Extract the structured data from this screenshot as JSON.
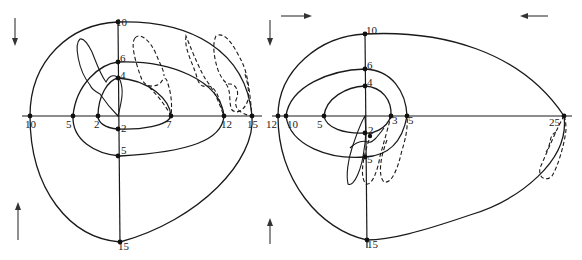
{
  "figure": {
    "panels": [
      {
        "id": "left",
        "arrows": [
          "down (top-left)",
          "up (bottom-left)"
        ],
        "axis_labels": {
          "horizontal": [
            "10",
            "5",
            "2",
            "7",
            "12",
            "15"
          ],
          "vertical": [
            "10",
            "6",
            "4",
            "2",
            "5",
            "15"
          ]
        },
        "labels": {
          "h10": "10",
          "h5": "5",
          "h2": "2",
          "h7": "7",
          "h12": "12",
          "h15": "15",
          "v10": "10",
          "v6": "6",
          "v4": "4",
          "v2": "2",
          "v5": "5",
          "v15": "15"
        },
        "curves": {
          "solid_isolines": [
            "outer (10/15)",
            "middle (5/6/12)",
            "inner (2/4/7)"
          ],
          "dashed_loops": 3,
          "solid_loop": 1
        }
      },
      {
        "id": "right",
        "arrows": [
          "right (top-left)",
          "left (top-right)",
          "up (bottom-left)"
        ],
        "axis_labels": {
          "horizontal": [
            "12",
            "10",
            "5",
            "3",
            "5",
            "25"
          ],
          "vertical": [
            "10",
            "6",
            "4",
            "2",
            "5",
            "15"
          ]
        },
        "labels": {
          "h12": "12",
          "h10": "10",
          "h5": "5",
          "h3": "3",
          "h5b": "5",
          "h25": "25",
          "v10": "10",
          "v6": "6",
          "v4": "4",
          "v2": "2",
          "v5": "5",
          "v15": "15"
        },
        "curves": {
          "solid_isolines": [
            "outer (10/12/15/25)",
            "middle (6/10/5)",
            "inner (4/5/3)"
          ],
          "dashed_loops": 3,
          "solid_loop": 1
        }
      }
    ]
  }
}
